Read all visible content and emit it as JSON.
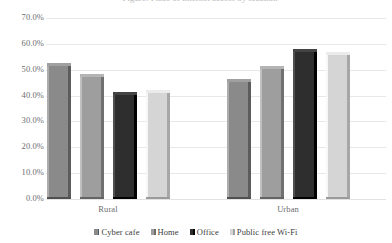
{
  "chart_data": {
    "type": "bar",
    "title": "",
    "xlabel": "",
    "ylabel": "",
    "categories": [
      "Rural",
      "Urban"
    ],
    "series": [
      {
        "name": "Cyber cafe",
        "values": [
          52.5,
          46.5
        ],
        "color": "#8a8a8a"
      },
      {
        "name": "Home",
        "values": [
          48.5,
          51.5
        ],
        "color": "#9e9e9e"
      },
      {
        "name": "Office",
        "values": [
          41.5,
          58.0
        ],
        "color": "#2e2e2e"
      },
      {
        "name": "Public free Wi-Fi",
        "values": [
          42.0,
          57.0
        ],
        "color": "#d5d5d5"
      }
    ],
    "ylim": [
      0,
      70
    ],
    "ytick_step": 10,
    "ytick_labels": [
      "0.0%",
      "10.0%",
      "20.0%",
      "30.0%",
      "40.0%",
      "50.0%",
      "60.0%",
      "70.0%"
    ],
    "ytick_values": [
      0,
      10,
      20,
      30,
      40,
      50,
      60,
      70
    ],
    "value_format": "percent",
    "grid": true,
    "legend_position": "bottom",
    "bar_style": "3d-bevel"
  },
  "title_sliver": {
    "text": "Figure: Place of internet access by location"
  },
  "colors": {
    "gridline": "#e8e8e8",
    "axis_text": "#6d6d6d",
    "legend_text": "#3c3c3c",
    "background": "#ffffff"
  }
}
